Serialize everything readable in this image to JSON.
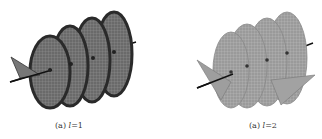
{
  "figures": [
    {
      "label": "(a)",
      "variable": "l",
      "equals": "=",
      "value": "1",
      "caption": "(a) l = 1",
      "style": "dark shaded helical surface with wire mesh, 4 turns, black axis line"
    },
    {
      "label": "(a)",
      "variable": "l",
      "equals": "=",
      "value": "2",
      "caption": "(a) l = 2",
      "style": "light gray helical surface with wire mesh, 4 turns, black axis line"
    }
  ],
  "colors": {
    "dark_surface": "#555555",
    "dark_edge": "#2a2a2a",
    "light_surface": "#9a9a9a",
    "mesh": "#bdbdbd",
    "axis": "#111111"
  }
}
